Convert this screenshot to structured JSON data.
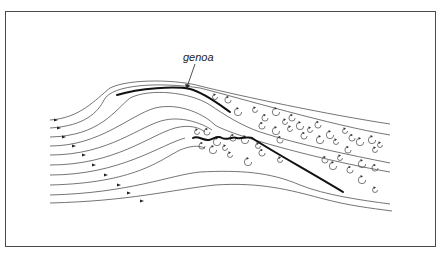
{
  "diagram": {
    "label": "genoa"
  }
}
